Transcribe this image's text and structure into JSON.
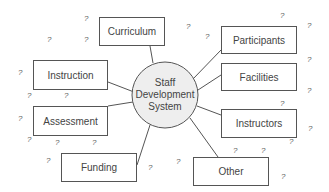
{
  "diagram": {
    "center": {
      "lines": [
        "Staff",
        "Development",
        "System"
      ],
      "fill": "#eeeeee",
      "cx": 165,
      "cy": 95,
      "r": 33
    },
    "nodes": [
      {
        "label": "Curriculum",
        "x": 99,
        "y": 17,
        "w": 66,
        "h": 29,
        "ax": 150,
        "ay": 46,
        "bx": 153,
        "by": 63
      },
      {
        "label": "Participants",
        "x": 221,
        "y": 26,
        "w": 76,
        "h": 28,
        "ax": 221,
        "ay": 50,
        "bx": 193,
        "by": 79
      },
      {
        "label": "Instruction",
        "x": 33,
        "y": 60,
        "w": 75,
        "h": 30,
        "ax": 108,
        "ay": 82,
        "bx": 134,
        "by": 92
      },
      {
        "label": "Facilities",
        "x": 221,
        "y": 63,
        "w": 76,
        "h": 28,
        "ax": 221,
        "ay": 75,
        "bx": 198,
        "by": 90
      },
      {
        "label": "Assessment",
        "x": 33,
        "y": 106,
        "w": 75,
        "h": 30,
        "ax": 108,
        "ay": 106,
        "bx": 133,
        "by": 102
      },
      {
        "label": "Instructors",
        "x": 221,
        "y": 109,
        "w": 76,
        "h": 29,
        "ax": 221,
        "ay": 115,
        "bx": 197,
        "by": 106
      },
      {
        "label": "Funding",
        "x": 61,
        "y": 153,
        "w": 76,
        "h": 29,
        "ax": 137,
        "ay": 165,
        "bx": 150,
        "by": 125
      },
      {
        "label": "Other",
        "x": 193,
        "y": 157,
        "w": 76,
        "h": 29,
        "ax": 218,
        "ay": 157,
        "bx": 190,
        "by": 118
      }
    ],
    "question_marks": [
      {
        "text": "?",
        "x": 84,
        "y": 15
      },
      {
        "text": "?",
        "x": 47,
        "y": 36
      },
      {
        "text": "?",
        "x": 84,
        "y": 36
      },
      {
        "text": "?",
        "x": 18,
        "y": 69
      },
      {
        "text": "?",
        "x": 27,
        "y": 92
      },
      {
        "text": "?",
        "x": 64,
        "y": 92
      },
      {
        "text": "?",
        "x": 18,
        "y": 115
      },
      {
        "text": "?",
        "x": 27,
        "y": 136
      },
      {
        "text": "?",
        "x": 55,
        "y": 139
      },
      {
        "text": "?",
        "x": 92,
        "y": 139
      },
      {
        "text": "?",
        "x": 46,
        "y": 157
      },
      {
        "text": "?",
        "x": 148,
        "y": 164
      },
      {
        "text": "?",
        "x": 186,
        "y": 23
      },
      {
        "text": "?",
        "x": 205,
        "y": 33
      },
      {
        "text": "?",
        "x": 280,
        "y": 12
      },
      {
        "text": "?",
        "x": 307,
        "y": 22
      },
      {
        "text": "?",
        "x": 307,
        "y": 56
      },
      {
        "text": "?",
        "x": 307,
        "y": 87
      },
      {
        "text": "?",
        "x": 280,
        "y": 100
      },
      {
        "text": "?",
        "x": 308,
        "y": 125
      },
      {
        "text": "?",
        "x": 289,
        "y": 138
      },
      {
        "text": "?",
        "x": 233,
        "y": 147
      },
      {
        "text": "?",
        "x": 261,
        "y": 147
      },
      {
        "text": "?",
        "x": 176,
        "y": 158
      },
      {
        "text": "?",
        "x": 281,
        "y": 173
      }
    ]
  }
}
